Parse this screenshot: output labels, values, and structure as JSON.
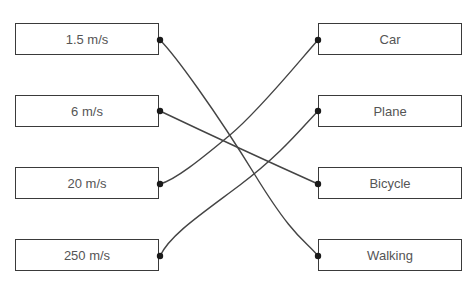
{
  "diagram": {
    "type": "matching",
    "left_items": [
      {
        "label": "1.5 m/s"
      },
      {
        "label": "6 m/s"
      },
      {
        "label": "20 m/s"
      },
      {
        "label": "250 m/s"
      }
    ],
    "right_items": [
      {
        "label": "Car"
      },
      {
        "label": "Plane"
      },
      {
        "label": "Bicycle"
      },
      {
        "label": "Walking"
      }
    ],
    "connections": [
      {
        "from": "1.5 m/s",
        "to": "Walking"
      },
      {
        "from": "6 m/s",
        "to": "Bicycle"
      },
      {
        "from": "20 m/s",
        "to": "Car"
      },
      {
        "from": "250 m/s",
        "to": "Plane"
      }
    ],
    "colors": {
      "line": "#444444",
      "dot": "#1a1a1a",
      "box_border": "#3a3a3a",
      "text": "#555555"
    }
  }
}
